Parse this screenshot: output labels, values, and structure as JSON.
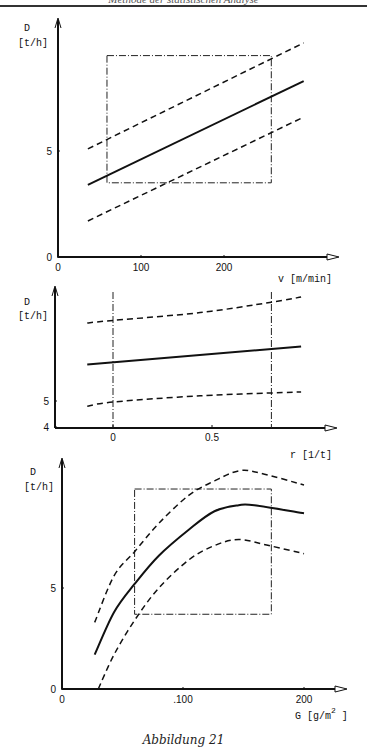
{
  "page": {
    "header_text": "Methode der statistischen Analyse",
    "caption": "Abbildung 21"
  },
  "chart_data": [
    {
      "type": "line",
      "title": "",
      "xlabel": "v [m/min]",
      "ylabel": "D [t/h]",
      "xlim": [
        0,
        300
      ],
      "ylim": [
        0,
        11.5
      ],
      "xticks": [
        0,
        100,
        200
      ],
      "xtick_labels": [
        "0",
        "100",
        "200"
      ],
      "yticks": [
        0,
        5
      ],
      "ytick_labels": [
        "0",
        "5"
      ],
      "grid": false,
      "legend": null,
      "plot_box": {
        "x": [
          59,
          300
        ],
        "y0": 257,
        "y_unit_px": 21.2,
        "x_unit_px": 0.83
      },
      "series": [
        {
          "name": "Regression",
          "style": "solid",
          "x": [
            36,
            296
          ],
          "y": [
            3.4,
            8.3
          ]
        },
        {
          "name": "Obere Grenze",
          "style": "dashed",
          "x": [
            36,
            296
          ],
          "y": [
            5.1,
            10.1
          ]
        },
        {
          "name": "Untere Grenze",
          "style": "dashed",
          "x": [
            36,
            296
          ],
          "y": [
            1.7,
            6.6
          ]
        }
      ],
      "region": {
        "style": "dash-dot",
        "x": [
          59,
          257
        ],
        "y": [
          3.5,
          9.5
        ]
      }
    },
    {
      "type": "line",
      "title": "",
      "xlabel": "r [1/t]",
      "ylabel": "D [t/h]",
      "xlim": [
        -0.27,
        0.95
      ],
      "ylim": [
        4,
        9
      ],
      "xticks": [
        0,
        0.5
      ],
      "xtick_labels": [
        "0",
        "0.5"
      ],
      "yticks": [
        4,
        5
      ],
      "ytick_labels": [
        "4",
        "5"
      ],
      "grid": false,
      "legend": null,
      "plot_box": {
        "x0_px": 113,
        "y0": 427,
        "y_unit_px": 26,
        "x_unit_px": 198
      },
      "series": [
        {
          "name": "Regression",
          "style": "solid",
          "x": [
            -0.13,
            0.95
          ],
          "y": [
            6.4,
            7.1
          ]
        },
        {
          "name": "Obere Grenze",
          "style": "dashed",
          "x": [
            -0.13,
            0,
            0.44,
            0.8,
            0.95
          ],
          "y": [
            8.0,
            8.1,
            8.4,
            8.8,
            9.0
          ]
        },
        {
          "name": "Untere Grenze",
          "style": "dashed",
          "x": [
            -0.13,
            0,
            0.44,
            0.95
          ],
          "y": [
            4.8,
            4.96,
            5.2,
            5.35
          ]
        }
      ],
      "region": {
        "style": "dash-dot",
        "x": [
          0,
          0.8
        ]
      }
    },
    {
      "type": "line",
      "title": "",
      "xlabel": "G [g/m²]",
      "ylabel": "D [t/h]",
      "xlim": [
        0,
        240
      ],
      "ylim": [
        0,
        11.5
      ],
      "xticks": [
        0,
        100,
        200
      ],
      "xtick_labels": [
        "0",
        ".100",
        "200"
      ],
      "yticks": [
        0,
        5
      ],
      "ytick_labels": [
        "0",
        "5"
      ],
      "grid": false,
      "legend": null,
      "plot_box": {
        "x0_px": 63,
        "y0": 689,
        "y_unit_px": 20.2,
        "x_unit_px": 1.21
      },
      "series": [
        {
          "name": "Regression",
          "style": "solid",
          "x": [
            27,
            43,
            60,
            80,
            105,
            126,
            146,
            159,
            200
          ],
          "y": [
            1.7,
            3.8,
            5.2,
            6.6,
            7.9,
            8.8,
            9.1,
            9.1,
            8.7
          ]
        },
        {
          "name": "Obere Grenze",
          "style": "dashed",
          "x": [
            27,
            43,
            60,
            80,
            105,
            126,
            146,
            163,
            200
          ],
          "y": [
            3.3,
            5.6,
            6.8,
            8.2,
            9.6,
            10.3,
            10.8,
            10.7,
            10.1
          ]
        },
        {
          "name": "Untere Grenze",
          "style": "dashed",
          "x": [
            30,
            43,
            60,
            80,
            105,
            126,
            146,
            171,
            200
          ],
          "y": [
            0,
            1.7,
            3.4,
            5.0,
            6.4,
            7.1,
            7.4,
            7.1,
            6.7
          ]
        }
      ],
      "region": {
        "style": "dash-dot",
        "x": [
          60,
          173
        ],
        "y": [
          3.7,
          9.9
        ]
      }
    }
  ]
}
